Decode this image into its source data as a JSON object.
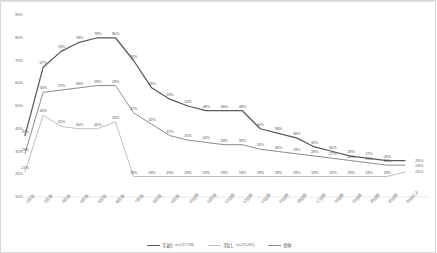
{
  "chart_data": {
    "type": "line",
    "title": "",
    "xlabel": "",
    "ylabel": "",
    "ylim": [
      10,
      90
    ],
    "yticks": [
      "10%",
      "20%",
      "30%",
      "40%",
      "50%",
      "60%",
      "70%",
      "80%",
      "90%"
    ],
    "grid": false,
    "legend_position": "bottom",
    "categories": [
      "1日目",
      "2日目",
      "3日目",
      "4日目",
      "5日目",
      "6日目",
      "7日目",
      "8日目",
      "9日目",
      "10日目",
      "11日目",
      "12日目",
      "13日目",
      "14日目",
      "15日目",
      "16日目",
      "17日目",
      "18日目",
      "19日目",
      "20日目",
      "30日目",
      "30日以上"
    ],
    "series": [
      {
        "name": "手あり",
        "n_label": "(n=217,738)",
        "color": "#595959",
        "values": [
          37,
          67,
          74,
          78,
          80,
          80,
          70,
          58,
          53,
          50,
          48,
          48,
          48,
          40,
          38,
          36,
          32,
          30,
          28,
          27,
          26,
          26
        ],
        "labels": [
          "37%",
          "67%",
          "74%",
          "78%",
          "78%",
          "80%",
          "70%",
          "58%",
          "53%",
          "50%",
          "48%",
          "48%",
          "48%",
          "40%",
          "38%",
          "36%",
          "32%",
          "30%",
          "28%",
          "27%",
          "26%",
          "26%"
        ]
      },
      {
        "name": "全体",
        "n_label": "",
        "color": "#8c8c8c",
        "values": [
          29,
          56,
          57,
          58,
          59,
          59,
          47,
          42,
          37,
          35,
          34,
          33,
          33,
          31,
          30,
          29,
          28,
          27,
          26,
          25,
          24,
          24
        ],
        "labels": [
          "29%",
          "56%",
          "57%",
          "58%",
          "59%",
          "59%",
          "47%",
          "42%",
          "37%",
          "35%",
          "34%",
          "33%",
          "33%",
          "31%",
          "30%",
          "29%",
          "28%",
          "27%",
          "26%",
          "25%",
          "24%",
          "24%"
        ]
      },
      {
        "name": "手なし",
        "n_label": "(n=255,945)",
        "color": "#bfbfbf",
        "values": [
          21,
          46,
          41,
          40,
          40,
          43,
          19,
          19,
          19,
          19,
          19,
          19,
          19,
          19,
          19,
          19,
          19,
          19,
          19,
          19,
          19,
          21
        ],
        "labels": [
          "21%",
          "46%",
          "41%",
          "40%",
          "40%",
          "43%",
          "19%",
          "19%",
          "19%",
          "19%",
          "19%",
          "19%",
          "19%",
          "19%",
          "19%",
          "19%",
          "19%",
          "19%",
          "19%",
          "19%",
          "19%",
          "21%"
        ]
      }
    ],
    "end_labels": [
      "26%",
      "24%",
      "21%"
    ]
  },
  "legend": {
    "items": [
      {
        "label": "手あり",
        "n": "(n=217,738)",
        "color": "#595959"
      },
      {
        "label": "手なし",
        "n": "(n=255,945)",
        "color": "#bfbfbf"
      },
      {
        "label": "全体",
        "n": "",
        "color": "#8c8c8c"
      }
    ]
  }
}
